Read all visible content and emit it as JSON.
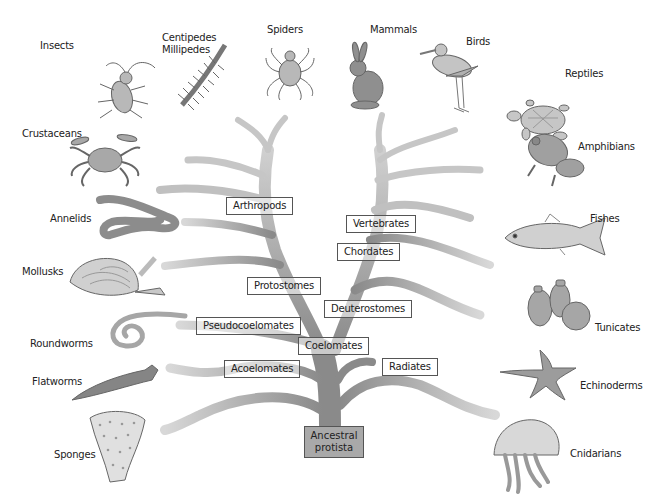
{
  "diagram": {
    "type": "phylogenetic-tree",
    "root": {
      "label": "Ancestral\nprotista",
      "line1": "Ancestral",
      "line2": "protista"
    },
    "colors": {
      "trunk": "#8a8a8a",
      "trunk_light": "#c4c4c4",
      "box_border": "#555555",
      "root_fill": "#a9a9a9",
      "text": "#222222"
    },
    "clade_labels": [
      {
        "id": "arthropods",
        "label": "Arthropods"
      },
      {
        "id": "vertebrates",
        "label": "Vertebrates"
      },
      {
        "id": "chordates",
        "label": "Chordates"
      },
      {
        "id": "protostomes",
        "label": "Protostomes"
      },
      {
        "id": "deuterostomes",
        "label": "Deuterostomes"
      },
      {
        "id": "pseudocoelomates",
        "label": "Pseudocoelomates"
      },
      {
        "id": "coelomates",
        "label": "Coelomates"
      },
      {
        "id": "acoelomates",
        "label": "Acoelomates"
      },
      {
        "id": "radiates",
        "label": "Radiates"
      }
    ],
    "organisms": [
      {
        "id": "insects",
        "label": "Insects",
        "icon": "beetle-icon"
      },
      {
        "id": "centipedes",
        "label": "Centipedes",
        "label2": "Millipedes",
        "icon": "centipede-icon"
      },
      {
        "id": "spiders",
        "label": "Spiders",
        "icon": "spider-icon"
      },
      {
        "id": "mammals",
        "label": "Mammals",
        "icon": "rabbit-icon"
      },
      {
        "id": "birds",
        "label": "Birds",
        "icon": "bird-icon"
      },
      {
        "id": "reptiles",
        "label": "Reptiles",
        "icon": "turtle-icon"
      },
      {
        "id": "crustaceans",
        "label": "Crustaceans",
        "icon": "crab-icon"
      },
      {
        "id": "amphibians",
        "label": "Amphibians",
        "icon": "frog-icon"
      },
      {
        "id": "annelids",
        "label": "Annelids",
        "icon": "earthworm-icon"
      },
      {
        "id": "fishes",
        "label": "Fishes",
        "icon": "fish-icon"
      },
      {
        "id": "mollusks",
        "label": "Mollusks",
        "icon": "clam-icon"
      },
      {
        "id": "tunicates",
        "label": "Tunicates",
        "icon": "tunicate-icon"
      },
      {
        "id": "roundworms",
        "label": "Roundworms",
        "icon": "roundworm-icon"
      },
      {
        "id": "echinoderms",
        "label": "Echinoderms",
        "icon": "starfish-icon"
      },
      {
        "id": "flatworms",
        "label": "Flatworms",
        "icon": "flatworm-icon"
      },
      {
        "id": "sponges",
        "label": "Sponges",
        "icon": "sponge-icon"
      },
      {
        "id": "cnidarians",
        "label": "Cnidarians",
        "icon": "jellyfish-icon"
      }
    ]
  }
}
